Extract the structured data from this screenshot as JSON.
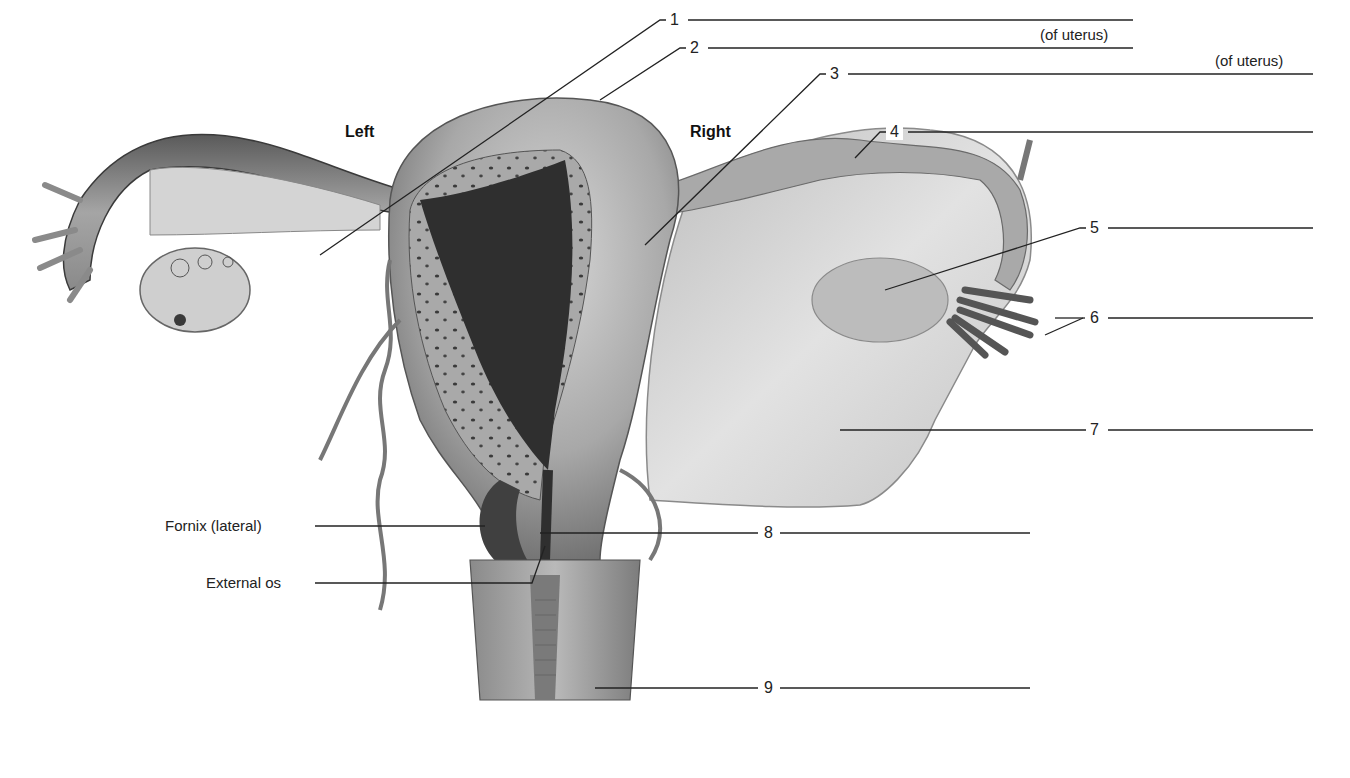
{
  "figure": {
    "orientation": {
      "left": "Left",
      "right": "Right"
    },
    "numbered_labels": [
      {
        "num": "1",
        "suffix": ""
      },
      {
        "num": "2",
        "suffix": "(of uterus)"
      },
      {
        "num": "3",
        "suffix": "(of uterus)"
      },
      {
        "num": "4",
        "suffix": ""
      },
      {
        "num": "5",
        "suffix": ""
      },
      {
        "num": "6",
        "suffix": ""
      },
      {
        "num": "7",
        "suffix": ""
      },
      {
        "num": "8",
        "suffix": ""
      },
      {
        "num": "9",
        "suffix": ""
      }
    ],
    "named_labels": [
      {
        "text": "Fornix (lateral)"
      },
      {
        "text": "External os"
      }
    ],
    "colors": {
      "tissue_light": "#c9c9c9",
      "tissue_mid": "#9a9a9a",
      "tissue_dark": "#4a4a4a",
      "cavity": "#2e2e2e",
      "leader_line": "#222222"
    }
  }
}
